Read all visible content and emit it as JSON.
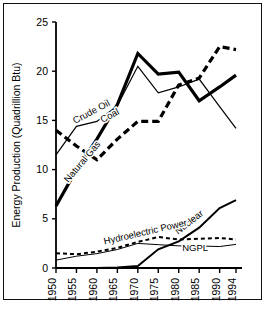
{
  "figure": {
    "name": "us-energy-production-by-source",
    "frame_color": "#111111",
    "background": "#ffffff"
  },
  "chart_data": {
    "type": "line",
    "title": "",
    "xlabel": "",
    "ylabel": "Energy Production (Quadrillion Btu)",
    "x": [
      1950,
      1955,
      1960,
      1965,
      1970,
      1975,
      1980,
      1985,
      1990,
      1994
    ],
    "xtick_labels": [
      "1950",
      "1955",
      "1960",
      "1965",
      "1970",
      "1975",
      "1980",
      "1985",
      "1990",
      "1994"
    ],
    "ytick_labels": [
      "0",
      "5",
      "10",
      "15",
      "20",
      "25"
    ],
    "yticks": [
      0,
      5,
      10,
      15,
      20,
      25
    ],
    "ylim": [
      0,
      25
    ],
    "xlim": [
      1950,
      1994
    ],
    "grid": false,
    "legend": "inline-labels",
    "series": [
      {
        "name": "Coal",
        "label": "Coal",
        "style": "thick-dashed",
        "color": "#000000",
        "width": 3.2,
        "dash": "7,4",
        "values": [
          14.0,
          12.4,
          11.0,
          13.1,
          14.9,
          14.9,
          18.6,
          19.3,
          22.5,
          22.2
        ],
        "label_x": 1963.5,
        "label_y": 15.2,
        "label_rotate": -28
      },
      {
        "name": "Natural Gas",
        "label": "Natural Gas",
        "style": "thick-solid",
        "color": "#000000",
        "width": 3.2,
        "dash": "",
        "values": [
          6.3,
          10.0,
          13.1,
          16.6,
          21.8,
          19.7,
          19.9,
          17.0,
          18.4,
          19.6
        ],
        "label_x": 1957.0,
        "label_y": 10.6,
        "label_rotate": -50
      },
      {
        "name": "Crude Oil",
        "label": "Crude Oil",
        "style": "thin-solid",
        "color": "#000000",
        "width": 1.2,
        "dash": "",
        "values": [
          11.5,
          14.4,
          14.9,
          16.5,
          20.5,
          17.8,
          18.4,
          19.2,
          16.4,
          14.2
        ],
        "label_x": 1959.0,
        "label_y": 15.6,
        "label_rotate": -28
      },
      {
        "name": "Nuclear",
        "label": "Nuclear",
        "style": "medium-solid",
        "color": "#000000",
        "width": 2.0,
        "dash": "",
        "values": [
          0.0,
          0.0,
          0.0,
          0.05,
          0.2,
          1.9,
          2.7,
          4.1,
          6.1,
          6.9
        ],
        "label_x": 1983.0,
        "label_y": 4.4,
        "label_rotate": -38
      },
      {
        "name": "Hydroelectric Power",
        "label": "Hydroelectric Power",
        "style": "medium-dashed",
        "color": "#000000",
        "width": 2.0,
        "dash": "4,3",
        "values": [
          1.5,
          1.4,
          1.65,
          2.05,
          2.65,
          3.15,
          2.9,
          2.97,
          3.05,
          2.9
        ],
        "label_x": 1972.0,
        "label_y": 3.35,
        "label_rotate": -13
      },
      {
        "name": "NGPL",
        "label": "NGPL",
        "style": "thin-solid",
        "color": "#000000",
        "width": 1.0,
        "dash": "",
        "values": [
          0.8,
          1.2,
          1.46,
          1.88,
          2.5,
          2.37,
          2.25,
          2.24,
          2.18,
          2.4
        ],
        "label_x": 1984.0,
        "label_y": 1.75,
        "label_rotate": 0
      }
    ]
  }
}
